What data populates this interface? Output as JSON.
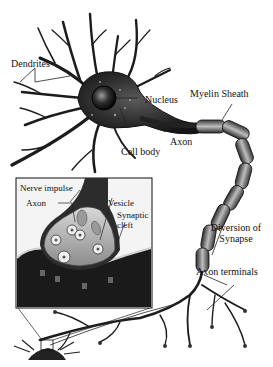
{
  "diagram": {
    "labels": {
      "dendrites": "Dendrites",
      "nucleus": "Nucleus",
      "cell_body": "Cell body",
      "axon": "Axon",
      "myelin_sheath": "Myelin Sheath",
      "diversion_line1": "Diversion of",
      "diversion_line2": "Synapse",
      "axon_terminals": "Axon terminals"
    },
    "inset": {
      "nerve_impulse": "Nerve impulse",
      "axon": "Axon",
      "vesicle": "Vesicle",
      "synaptic_cleft_line1": "Synaptic",
      "synaptic_cleft_line2": "cleft"
    },
    "colors": {
      "ink": "#111111",
      "body": "#2a2a2a",
      "myelin": "#6b6b6b",
      "background": "#ffffff"
    }
  }
}
